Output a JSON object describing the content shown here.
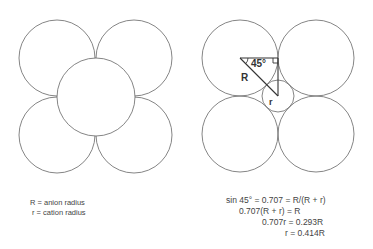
{
  "left_diagram": {
    "description": "Four anions arranged in a square with a central cation (square planar packing)",
    "anion_circles": [
      {
        "cx": 57,
        "cy": 58,
        "r": 38
      },
      {
        "cx": 134,
        "cy": 58,
        "r": 38
      },
      {
        "cx": 57,
        "cy": 135,
        "r": 38
      },
      {
        "cx": 134,
        "cy": 135,
        "r": 38
      }
    ],
    "central_circle": {
      "cx": 96,
      "cy": 97,
      "r": 39
    }
  },
  "right_diagram": {
    "description": "Four anions touching with small cation in the interstice; right triangle showing geometry",
    "anion_circles": [
      {
        "cx": 240,
        "cy": 58,
        "r": 38
      },
      {
        "cx": 316,
        "cy": 58,
        "r": 38
      },
      {
        "cx": 240,
        "cy": 134,
        "r": 38
      },
      {
        "cx": 316,
        "cy": 134,
        "r": 38
      }
    ],
    "cation_circle": {
      "cx": 278,
      "cy": 96,
      "r": 16
    },
    "angle_label": "45°",
    "R_label": "R",
    "r_label": "r"
  },
  "legend": {
    "line1": "R = anion radius",
    "line2": "r = cation radius"
  },
  "equations": {
    "line1": "sin 45° = 0.707 = R/(R + r)",
    "line2": "0.707(R + r) = R",
    "line3": "0.707r = 0.293R",
    "line4": "r = 0.414R"
  },
  "colors": {
    "stroke": "#555555",
    "text": "#333333",
    "background": "#ffffff"
  }
}
